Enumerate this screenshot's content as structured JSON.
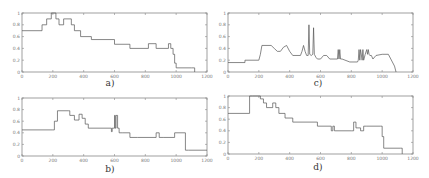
{
  "chart_data": [
    {
      "id": "a",
      "type": "line",
      "caption": "a)",
      "title": "",
      "xlabel": "",
      "ylabel": "",
      "xlim": [
        0,
        1200
      ],
      "ylim": [
        0,
        1
      ],
      "xticks": [
        0,
        200,
        400,
        600,
        800,
        1000,
        1200
      ],
      "yticks": [
        0,
        0.2,
        0.4,
        0.6,
        0.8,
        1
      ],
      "grid": false,
      "series": [
        {
          "name": "a",
          "step": true,
          "x": [
            0,
            130,
            160,
            190,
            220,
            240,
            270,
            320,
            340,
            380,
            450,
            600,
            700,
            820,
            870,
            950,
            965,
            980,
            990,
            1000,
            1100,
            1120
          ],
          "y": [
            0.7,
            0.8,
            0.9,
            1.0,
            0.9,
            0.8,
            0.9,
            0.8,
            0.7,
            0.6,
            0.55,
            0.47,
            0.4,
            0.48,
            0.4,
            0.48,
            0.4,
            0.3,
            0.15,
            0.07,
            0.07,
            0.0
          ]
        }
      ],
      "dashed_start": {
        "x": [
          0,
          130
        ],
        "y": [
          0.7,
          0.7
        ]
      }
    },
    {
      "id": "b",
      "type": "line",
      "caption": "b)",
      "title": "",
      "xlabel": "",
      "ylabel": "",
      "xlim": [
        0,
        1200
      ],
      "ylim": [
        0,
        1
      ],
      "xticks": [
        0,
        200,
        400,
        600,
        800,
        1000,
        1200
      ],
      "yticks": [
        0,
        0.2,
        0.4,
        0.6,
        0.8,
        1
      ],
      "grid": false,
      "series": [
        {
          "name": "b",
          "step": true,
          "x": [
            0,
            200,
            210,
            230,
            300,
            310,
            340,
            370,
            390,
            410,
            430,
            580,
            585,
            600,
            605,
            610,
            620,
            630,
            650,
            700,
            750,
            870,
            890,
            920,
            990,
            1060,
            1080,
            1200
          ],
          "y": [
            0.45,
            0.45,
            0.6,
            0.78,
            0.78,
            0.7,
            0.62,
            0.72,
            0.65,
            0.55,
            0.48,
            0.42,
            0.48,
            0.7,
            0.48,
            0.7,
            0.48,
            0.4,
            0.4,
            0.32,
            0.32,
            0.4,
            0.32,
            0.32,
            0.4,
            0.1,
            0.1,
            0.1
          ]
        }
      ]
    },
    {
      "id": "c",
      "type": "line",
      "caption": "c)",
      "title": "",
      "xlabel": "",
      "ylabel": "",
      "xlim": [
        0,
        1200
      ],
      "ylim": [
        0,
        1
      ],
      "xticks": [
        0,
        200,
        400,
        600,
        800,
        1000,
        1200
      ],
      "yticks": [
        0,
        0.2,
        0.4,
        0.6,
        0.8,
        1
      ],
      "grid": false,
      "series": [
        {
          "name": "c",
          "step": false,
          "x": [
            0,
            110,
            110,
            200,
            210,
            220,
            280,
            300,
            320,
            340,
            360,
            380,
            400,
            420,
            470,
            480,
            490,
            500,
            510,
            520,
            525,
            530,
            540,
            550,
            555,
            560,
            570,
            580,
            600,
            620,
            640,
            660,
            700,
            710,
            715,
            720,
            725,
            730,
            740,
            790,
            840,
            845,
            850,
            855,
            860,
            870,
            875,
            880,
            890,
            900,
            905,
            910,
            915,
            920,
            930,
            940,
            960,
            1000,
            1040,
            1080,
            1090
          ],
          "y": [
            0.16,
            0.16,
            0.2,
            0.2,
            0.3,
            0.45,
            0.45,
            0.4,
            0.35,
            0.35,
            0.42,
            0.45,
            0.35,
            0.28,
            0.28,
            0.35,
            0.45,
            0.35,
            0.28,
            0.28,
            0.8,
            0.3,
            0.28,
            0.3,
            0.75,
            0.3,
            0.25,
            0.22,
            0.22,
            0.28,
            0.28,
            0.22,
            0.22,
            0.22,
            0.38,
            0.22,
            0.38,
            0.22,
            0.22,
            0.17,
            0.17,
            0.2,
            0.38,
            0.2,
            0.38,
            0.2,
            0.38,
            0.2,
            0.3,
            0.38,
            0.3,
            0.38,
            0.3,
            0.28,
            0.28,
            0.22,
            0.28,
            0.3,
            0.3,
            0.1,
            0.0
          ]
        }
      ]
    },
    {
      "id": "d",
      "type": "line",
      "caption": "d)",
      "title": "",
      "xlabel": "",
      "ylabel": "",
      "xlim": [
        0,
        1200
      ],
      "ylim": [
        0,
        1
      ],
      "xticks": [
        0,
        200,
        400,
        600,
        800,
        1000,
        1200
      ],
      "yticks": [
        0,
        0.2,
        0.4,
        0.6,
        0.8,
        1
      ],
      "grid": false,
      "series": [
        {
          "name": "d",
          "step": true,
          "x": [
            0,
            140,
            160,
            200,
            210,
            230,
            250,
            290,
            310,
            330,
            370,
            420,
            580,
            670,
            680,
            690,
            800,
            815,
            830,
            860,
            880,
            900,
            990,
            1000,
            1010,
            1120,
            1130
          ],
          "y": [
            0.7,
            1.0,
            1.05,
            1.0,
            0.95,
            0.88,
            0.8,
            0.88,
            0.8,
            0.7,
            0.62,
            0.55,
            0.48,
            0.4,
            0.48,
            0.4,
            0.4,
            0.55,
            0.45,
            0.4,
            0.48,
            0.48,
            0.48,
            0.3,
            0.1,
            0.1,
            0.0
          ]
        }
      ]
    }
  ]
}
